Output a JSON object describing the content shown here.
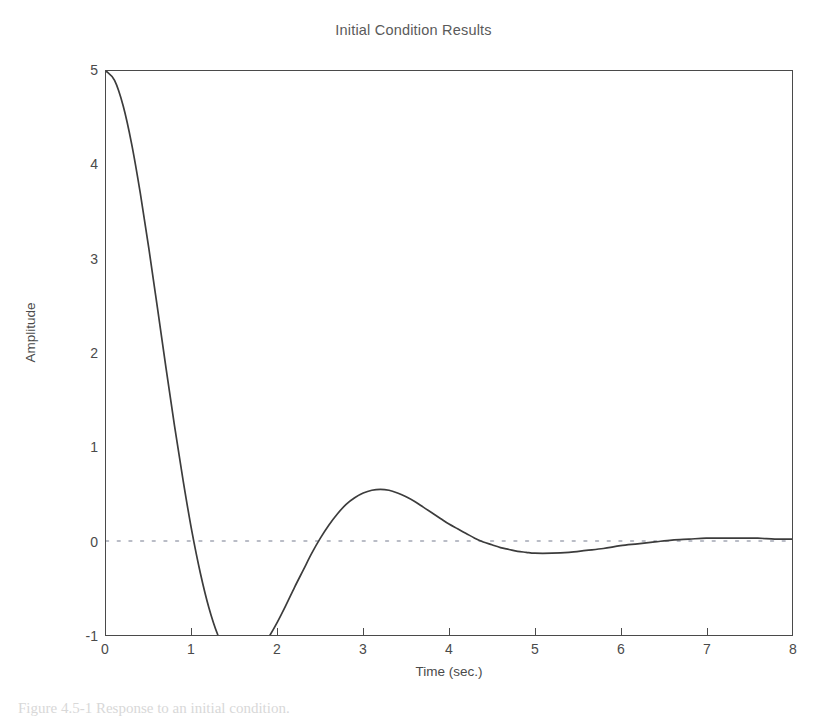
{
  "figure": {
    "caption_partial": "Figure 4.5-1 Response to an initial condition."
  },
  "chart_data": {
    "type": "line",
    "title": "Initial Condition Results",
    "xlabel": "Time (sec.)",
    "ylabel": "Amplitude",
    "xlim": [
      0,
      8
    ],
    "ylim": [
      -1,
      5
    ],
    "xticks": [
      0,
      1,
      2,
      3,
      4,
      5,
      6,
      7,
      8
    ],
    "yticks": [
      -1,
      0,
      1,
      2,
      3,
      4,
      5
    ],
    "xtick_labels": [
      "0",
      "1",
      "2",
      "3",
      "4",
      "5",
      "6",
      "7",
      "8"
    ],
    "ytick_labels": [
      "-1",
      "0",
      "1",
      "2",
      "3",
      "4",
      "5"
    ],
    "grid": false,
    "legend": null,
    "line_color": "#3c3c3c",
    "zero_line_color": "#b9bcc6",
    "zero_line_style": "dotted",
    "zero_line_value": 0,
    "annotations": {
      "initial_value": 5,
      "first_zero_crossing": 1.31,
      "minimum": {
        "x": 2.05,
        "y": -0.95
      },
      "second_zero_crossing": 3.56,
      "maximum": {
        "x": 4.32,
        "y": 0.17
      },
      "settling_time": 6.0
    },
    "series": [
      {
        "name": "Amplitude",
        "x": [
          0,
          0.1,
          0.2,
          0.3,
          0.4,
          0.5,
          0.6,
          0.7,
          0.8,
          0.9,
          1.0,
          1.1,
          1.2,
          1.3,
          1.4,
          1.5,
          1.6,
          1.7,
          1.8,
          1.9,
          2.0,
          2.1,
          2.2,
          2.3,
          2.4,
          2.5,
          2.6,
          2.7,
          2.8,
          2.9,
          3.0,
          3.1,
          3.2,
          3.3,
          3.4,
          3.5,
          3.6,
          3.7,
          3.8,
          3.9,
          4.0,
          4.1,
          4.2,
          4.3,
          4.4,
          4.5,
          4.6,
          4.7,
          4.8,
          4.9,
          5.0,
          5.2,
          5.4,
          5.6,
          5.8,
          6.0,
          6.2,
          6.4,
          6.6,
          6.8,
          7.0,
          7.2,
          7.4,
          7.6,
          7.8,
          8.0
        ],
        "y": [
          5.0,
          4.9,
          4.63,
          4.22,
          3.7,
          3.11,
          2.48,
          1.84,
          1.22,
          0.64,
          0.11,
          -0.34,
          -0.71,
          -0.99,
          -1.18,
          -1.28,
          -1.3,
          -1.26,
          -1.16,
          -1.02,
          -0.86,
          -0.68,
          -0.49,
          -0.31,
          -0.13,
          0.03,
          0.17,
          0.29,
          0.39,
          0.46,
          0.51,
          0.54,
          0.55,
          0.54,
          0.51,
          0.47,
          0.42,
          0.36,
          0.3,
          0.24,
          0.18,
          0.13,
          0.08,
          0.03,
          -0.01,
          -0.04,
          -0.07,
          -0.09,
          -0.11,
          -0.12,
          -0.13,
          -0.13,
          -0.12,
          -0.1,
          -0.08,
          -0.05,
          -0.03,
          -0.01,
          0.01,
          0.02,
          0.03,
          0.03,
          0.03,
          0.03,
          0.02,
          0.02
        ]
      }
    ]
  }
}
